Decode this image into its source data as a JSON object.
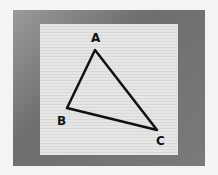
{
  "scene": {
    "description": "Photo of a hand-drawn triangle on textured paper over a gray background",
    "triangle": {
      "vertices": [
        {
          "label": "A",
          "x": 95,
          "y": 50
        },
        {
          "label": "B",
          "x": 67,
          "y": 108
        },
        {
          "label": "C",
          "x": 157,
          "y": 130
        }
      ]
    },
    "colors": {
      "ink": "#111111",
      "paper": "#e2e2e2",
      "background": "#7a7a7a"
    }
  }
}
